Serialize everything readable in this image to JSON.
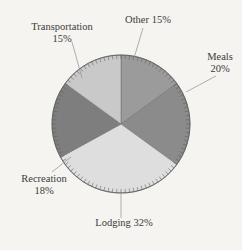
{
  "chart_data": {
    "type": "pie",
    "title": "",
    "subtitle": "",
    "xlabel": "",
    "ylabel": "",
    "legend_position": "none",
    "grid": false,
    "start_angle_deg": 90,
    "direction": "clockwise",
    "units": "percent",
    "total": 100,
    "categories": [
      "Other",
      "Meals",
      "Lodging",
      "Recreation",
      "Transportation"
    ],
    "values": [
      15,
      20,
      32,
      18,
      15
    ],
    "labels": [
      "Other 15%",
      "Meals 20%",
      "Lodging 32%",
      "Recreation 18%",
      "Transportation 15%"
    ],
    "colors": [
      "#9b9b9b",
      "#8b8b8b",
      "#dedede",
      "#7e7e7e",
      "#c9c9c9"
    ],
    "slices": [
      {
        "name": "Other",
        "value": 15,
        "label_line1": "Other 15%",
        "label_line2": "",
        "color": "#9b9b9b",
        "label_x": 148,
        "label_y": 23,
        "label_anchor": "middle",
        "leader_from_x": 143,
        "leader_from_y": 28,
        "leader_to_x": 134,
        "leader_to_y": 58
      },
      {
        "name": "Meals",
        "value": 20,
        "label_line1": "Meals",
        "label_line2": "20%",
        "color": "#8b8b8b",
        "label_x": 220,
        "label_y": 60,
        "label_anchor": "middle",
        "leader_from_x": 216,
        "leader_from_y": 76,
        "leader_to_x": 186,
        "leader_to_y": 92
      },
      {
        "name": "Lodging",
        "value": 32,
        "label_line1": "Lodging 32%",
        "label_line2": "",
        "color": "#dedede",
        "label_x": 124,
        "label_y": 226,
        "label_anchor": "middle",
        "leader_from_x": 121,
        "leader_from_y": 218,
        "leader_to_x": 121,
        "leader_to_y": 194
      },
      {
        "name": "Recreation",
        "value": 18,
        "label_line1": "Recreation",
        "label_line2": "18%",
        "color": "#7e7e7e",
        "label_x": 44,
        "label_y": 182,
        "label_anchor": "middle",
        "leader_from_x": 52,
        "leader_from_y": 172,
        "leader_to_x": 71,
        "leader_to_y": 157
      },
      {
        "name": "Transportation",
        "value": 15,
        "label_line1": "Transportation",
        "label_line2": "15%",
        "color": "#c9c9c9",
        "label_x": 62,
        "label_y": 30,
        "label_anchor": "middle",
        "leader_from_x": 72,
        "leader_from_y": 42,
        "leader_to_x": 82,
        "leader_to_y": 78
      }
    ],
    "geometry": {
      "center_x": 121,
      "center_y": 124,
      "radius": 69,
      "tick_count": 100,
      "tick_length": 4
    },
    "background_color": "#f6f4f1",
    "outline_color": "#5d5d5d",
    "text_color": "#3b3b3b"
  }
}
